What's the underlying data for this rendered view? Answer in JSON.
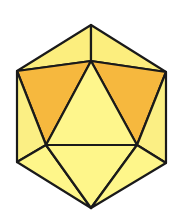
{
  "figure": {
    "stroke_color": "#1a1a1a",
    "stroke_width": 2.2,
    "colors": {
      "top": "#FCEE7E",
      "side": "#FBEF84",
      "center": "#FEF68C",
      "highlight": "#F6B83E",
      "bottom": "#FEF68A"
    },
    "vertices": {
      "T": [
        91,
        25
      ],
      "C": [
        91,
        61
      ],
      "UL": [
        17,
        71
      ],
      "UR": [
        166,
        72
      ],
      "BL": [
        46,
        145
      ],
      "BR": [
        137,
        145
      ],
      "LL": [
        17,
        162
      ],
      "LR": [
        166,
        163
      ],
      "B": [
        91,
        208
      ]
    },
    "faces": [
      {
        "name": "top-left-face",
        "pts": [
          "T",
          "UL",
          "C"
        ],
        "fill": "top"
      },
      {
        "name": "top-right-face",
        "pts": [
          "T",
          "C",
          "UR"
        ],
        "fill": "top"
      },
      {
        "name": "highlight-left-face",
        "pts": [
          "UL",
          "C",
          "BL"
        ],
        "fill": "highlight"
      },
      {
        "name": "highlight-right-face",
        "pts": [
          "C",
          "UR",
          "BR"
        ],
        "fill": "highlight"
      },
      {
        "name": "center-face",
        "pts": [
          "C",
          "BL",
          "BR"
        ],
        "fill": "center"
      },
      {
        "name": "left-side-face",
        "pts": [
          "UL",
          "BL",
          "LL"
        ],
        "fill": "side"
      },
      {
        "name": "right-side-face",
        "pts": [
          "UR",
          "LR",
          "BR"
        ],
        "fill": "side"
      },
      {
        "name": "bottom-left-face",
        "pts": [
          "LL",
          "BL",
          "B"
        ],
        "fill": "bottom"
      },
      {
        "name": "bottom-center-face",
        "pts": [
          "BL",
          "BR",
          "B"
        ],
        "fill": "bottom"
      },
      {
        "name": "bottom-right-face",
        "pts": [
          "BR",
          "LR",
          "B"
        ],
        "fill": "bottom"
      }
    ]
  }
}
